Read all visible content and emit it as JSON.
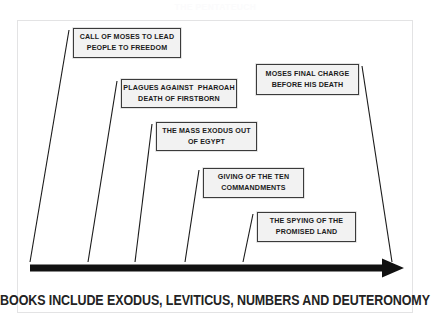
{
  "page": {
    "watermark_title": "THE PENTATEUCH",
    "background_color": "#ffffff",
    "frame_color": "#e3e3e4"
  },
  "diagram": {
    "type": "timeline",
    "axis": {
      "name": "exodus-timeline-arrow",
      "direction": "left-to-right",
      "color": "#111111",
      "start_x": 30,
      "end_x": 404,
      "y": 268
    },
    "callouts": [
      {
        "id": "call-of-moses",
        "lines": [
          "CALL OF MOSES TO LEAD",
          "PEOPLE TO FREEDOM"
        ],
        "left": 73,
        "top": 28,
        "width": 108,
        "height": 30,
        "tick_x": 30
      },
      {
        "id": "plagues-against-pharoah",
        "lines": [
          "PLAGUES AGAINST  PHAROAH",
          "DEATH OF FIRSTBORN"
        ],
        "left": 121,
        "top": 79,
        "width": 116,
        "height": 29,
        "tick_x": 88
      },
      {
        "id": "moses-final-charge",
        "lines": [
          "MOSES FINAL CHARGE",
          "BEFORE HIS DEATH"
        ],
        "left": 256,
        "top": 64,
        "width": 103,
        "height": 31,
        "tick_x": 392
      },
      {
        "id": "mass-exodus",
        "lines": [
          "THE MASS EXODUS OUT",
          "OF EGYPT"
        ],
        "left": 156,
        "top": 122,
        "width": 101,
        "height": 29,
        "tick_x": 135
      },
      {
        "id": "ten-commandments",
        "lines": [
          "GIVING OF THE TEN",
          "COMMANDMENTS"
        ],
        "left": 203,
        "top": 168,
        "width": 101,
        "height": 30,
        "tick_x": 185
      },
      {
        "id": "spying-promised-land",
        "lines": [
          "THE SPYING OF THE",
          "PROMISED LAND"
        ],
        "left": 257,
        "top": 212,
        "width": 99,
        "height": 30,
        "tick_x": 243
      }
    ],
    "box_fill": "#f2f2f2",
    "box_border": "#3b3b3b"
  },
  "caption": {
    "text": "BOOKS INCLUDE EXODUS, LEVITICUS, NUMBERS AND DEUTERONOMY"
  }
}
